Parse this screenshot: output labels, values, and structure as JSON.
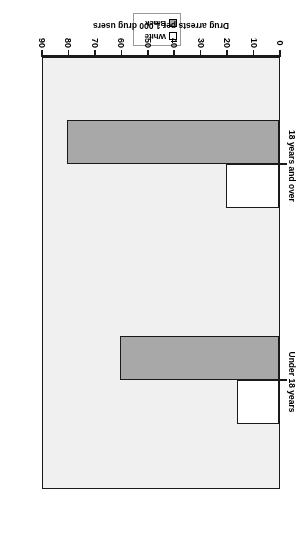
{
  "chart_data": {
    "type": "bar",
    "orientation": "horizontal",
    "title": "",
    "xlabel": "Drug arrests per 1,000 drug users",
    "ylabel": "",
    "categories": [
      "Under 18 years",
      "18 years and over"
    ],
    "series": [
      {
        "name": "White",
        "values": [
          16,
          20
        ],
        "color": "#ffffff"
      },
      {
        "name": "Black",
        "values": [
          60,
          80
        ],
        "color": "#a8a8a8"
      }
    ],
    "xlim": [
      0,
      90
    ],
    "xticks": [
      0,
      10,
      20,
      30,
      40,
      50,
      60,
      70,
      80,
      90
    ],
    "xtick_labels": [
      "0",
      "10",
      "20",
      "30",
      "40",
      "50",
      "60",
      "70",
      "80",
      "90"
    ],
    "grid": false,
    "legend_position": "top",
    "plot_background": "#f0f0f0",
    "frame_color": "#1a1a1a"
  },
  "legend": {
    "items": [
      {
        "label": "White",
        "swatch": "white-swatch"
      },
      {
        "label": "Black",
        "swatch": "black-swatch"
      }
    ]
  },
  "axis": {
    "title": "Drug arrests per 1,000 drug users",
    "ticks": [
      "0",
      "10",
      "20",
      "30",
      "40",
      "50",
      "60",
      "70",
      "80",
      "90"
    ]
  },
  "categories": [
    {
      "label": "Under 18 years"
    },
    {
      "label": "18 years and over"
    }
  ]
}
